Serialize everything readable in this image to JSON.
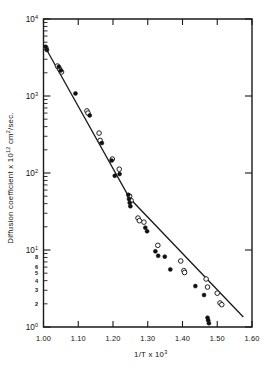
{
  "chart_data": {
    "type": "scatter",
    "title": "",
    "xlabel": "1/T x 10³",
    "ylabel": "Diffusion coefficient x 10¹² cm²/sec.",
    "xlabel_parts": {
      "base": "1/T  x  10",
      "sup": "3"
    },
    "ylabel_parts": {
      "pre": "Diffusion coefficient x 10",
      "sup1": "12",
      "mid": " cm",
      "sup2": "2",
      "post": "/sec."
    },
    "xlim": [
      1.0,
      1.6
    ],
    "ylim_log": [
      0,
      4
    ],
    "yscale": "log",
    "grid": false,
    "legend": null,
    "xticks": [
      1.0,
      1.1,
      1.2,
      1.3,
      1.4,
      1.5,
      1.6
    ],
    "xtick_labels": [
      "1.00",
      "1.10",
      "1.20",
      "1.30",
      "1.40",
      "1.50",
      "1.60"
    ],
    "ymajor_decades": [
      {
        "exp": "0",
        "label_base": "10",
        "label_sup": "0"
      },
      {
        "exp": "1",
        "label_base": "10",
        "label_sup": "1"
      },
      {
        "exp": "2",
        "label_base": "10",
        "label_sup": "2"
      },
      {
        "exp": "3",
        "label_base": "10",
        "label_sup": "3"
      },
      {
        "exp": "4",
        "label_base": "10",
        "label_sup": "4"
      }
    ],
    "yminor_labeled": [
      {
        "decade": 0,
        "mult": 2,
        "label": "2"
      },
      {
        "decade": 0,
        "mult": 3,
        "label": "3"
      },
      {
        "decade": 0,
        "mult": 4,
        "label": "4"
      },
      {
        "decade": 0,
        "mult": 5,
        "label": "5"
      },
      {
        "decade": 0,
        "mult": 6,
        "label": "6"
      },
      {
        "decade": 0,
        "mult": 8,
        "label": "8"
      }
    ],
    "axis_note": "Logarithmic y-axis spanning 10^0 to 10^4; linear x-axis 1.00 to 1.60. Ticks on all four sides, pointing inward.",
    "fit_line": {
      "name": "two-segment least-squares fit",
      "style": "solid",
      "color": "#1a1a1a",
      "breakpoint": {
        "x": 1.248,
        "y": 47.0
      },
      "points": [
        {
          "x": 1.005,
          "y": 4300.0
        },
        {
          "x": 1.248,
          "y": 47.0
        },
        {
          "x": 1.575,
          "y": 1.35
        }
      ]
    },
    "series": [
      {
        "name": "open circles",
        "marker": "open-circle",
        "points": [
          {
            "x": 1.007,
            "y": 4200
          },
          {
            "x": 1.04,
            "y": 2450
          },
          {
            "x": 1.046,
            "y": 2250
          },
          {
            "x": 1.052,
            "y": 2050
          },
          {
            "x": 1.125,
            "y": 640
          },
          {
            "x": 1.128,
            "y": 600
          },
          {
            "x": 1.16,
            "y": 330
          },
          {
            "x": 1.163,
            "y": 265
          },
          {
            "x": 1.198,
            "y": 152
          },
          {
            "x": 1.218,
            "y": 112
          },
          {
            "x": 1.248,
            "y": 50
          },
          {
            "x": 1.252,
            "y": 44
          },
          {
            "x": 1.272,
            "y": 26
          },
          {
            "x": 1.276,
            "y": 24
          },
          {
            "x": 1.289,
            "y": 23
          },
          {
            "x": 1.329,
            "y": 11.5
          },
          {
            "x": 1.395,
            "y": 7.2
          },
          {
            "x": 1.404,
            "y": 5.4
          },
          {
            "x": 1.406,
            "y": 5.1
          },
          {
            "x": 1.468,
            "y": 4.2
          },
          {
            "x": 1.472,
            "y": 3.3
          },
          {
            "x": 1.5,
            "y": 2.75
          },
          {
            "x": 1.508,
            "y": 2.05
          },
          {
            "x": 1.513,
            "y": 1.95
          }
        ]
      },
      {
        "name": "filled circles",
        "marker": "filled-circle",
        "points": [
          {
            "x": 1.006,
            "y": 4350
          },
          {
            "x": 1.01,
            "y": 3950
          },
          {
            "x": 1.044,
            "y": 2400
          },
          {
            "x": 1.05,
            "y": 2150
          },
          {
            "x": 1.092,
            "y": 1080
          },
          {
            "x": 1.133,
            "y": 560
          },
          {
            "x": 1.168,
            "y": 245
          },
          {
            "x": 1.196,
            "y": 145
          },
          {
            "x": 1.205,
            "y": 92
          },
          {
            "x": 1.219,
            "y": 97
          },
          {
            "x": 1.244,
            "y": 52
          },
          {
            "x": 1.246,
            "y": 46
          },
          {
            "x": 1.248,
            "y": 41
          },
          {
            "x": 1.25,
            "y": 37
          },
          {
            "x": 1.293,
            "y": 19.5
          },
          {
            "x": 1.298,
            "y": 17.5
          },
          {
            "x": 1.322,
            "y": 9.6
          },
          {
            "x": 1.33,
            "y": 8.4
          },
          {
            "x": 1.349,
            "y": 8.2
          },
          {
            "x": 1.365,
            "y": 5.6
          },
          {
            "x": 1.437,
            "y": 3.4
          },
          {
            "x": 1.462,
            "y": 2.6
          },
          {
            "x": 1.472,
            "y": 1.32
          },
          {
            "x": 1.474,
            "y": 1.22
          },
          {
            "x": 1.476,
            "y": 1.12
          }
        ]
      }
    ]
  }
}
